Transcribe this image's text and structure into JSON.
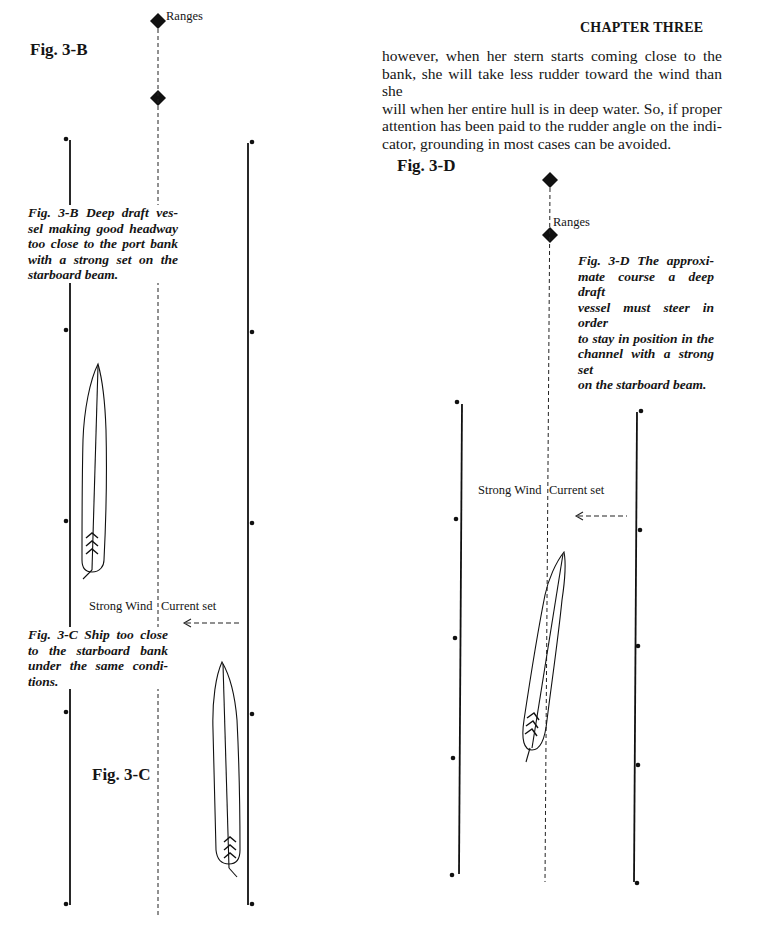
{
  "header": {
    "chapter": "CHAPTER THREE"
  },
  "body_text": {
    "lines": [
      "however, when her stern starts coming close to the",
      "bank, she will take less rudder toward the wind than she",
      "will when her entire hull is in deep water. So, if proper",
      "attention has been paid to the rudder angle on the indi-",
      "cator, grounding in most cases can be avoided."
    ]
  },
  "fig_3b": {
    "label": "Fig. 3-B",
    "ranges_label": "Ranges",
    "caption_lines": [
      "Fig. 3-B   Deep draft ves-",
      "sel making good headway",
      "too close to the port bank",
      "with a strong set on the",
      "starboard beam."
    ]
  },
  "fig_3c": {
    "label": "Fig. 3-C",
    "wind_label": "Strong Wind",
    "current_label": "Current set",
    "caption_lines": [
      "Fig. 3-C   Ship too close",
      "to the starboard bank",
      "under the same condi-",
      "tions."
    ]
  },
  "fig_3d": {
    "label": "Fig. 3-D",
    "ranges_label": "Ranges",
    "wind_label": "Strong Wind",
    "current_label": "Current set",
    "caption_lines": [
      "Fig. 3-D   The approxi-",
      "mate course a deep draft",
      "vessel must steer in order",
      "to stay in position in the",
      "channel with a strong set",
      "on the starboard beam."
    ]
  }
}
